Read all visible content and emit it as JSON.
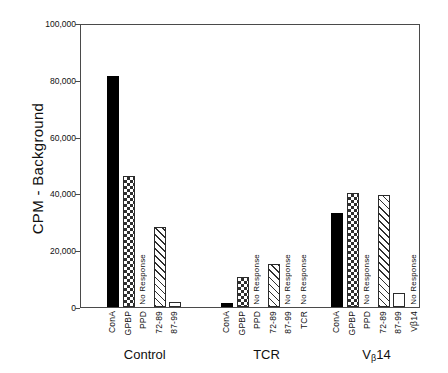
{
  "chart_data": {
    "type": "bar",
    "title": "",
    "xlabel": "",
    "ylabel": "CPM - Background",
    "ylim": [
      0,
      100000
    ],
    "yticks": [
      0,
      20000,
      40000,
      60000,
      80000,
      100000
    ],
    "ytick_labels": [
      "0",
      "20,000",
      "40,000",
      "60,000",
      "80,000",
      "100,000"
    ],
    "grid": false,
    "legend": "none",
    "groups": [
      {
        "name": "Control",
        "caption": "Control",
        "bars": [
          {
            "category": "ConA",
            "value": 81500,
            "fill": "solid",
            "annotation": ""
          },
          {
            "category": "GPBP",
            "value": 46000,
            "fill": "checker",
            "annotation": ""
          },
          {
            "category": "PPD",
            "value": 0,
            "fill": "none",
            "annotation": "No Response"
          },
          {
            "category": "72-89",
            "value": 28000,
            "fill": "diagonal",
            "annotation": ""
          },
          {
            "category": "87-99",
            "value": 1800,
            "fill": "open",
            "annotation": ""
          }
        ]
      },
      {
        "name": "TCR",
        "caption": "TCR",
        "bars": [
          {
            "category": "ConA",
            "value": 1500,
            "fill": "solid",
            "annotation": ""
          },
          {
            "category": "GPBP",
            "value": 10500,
            "fill": "checker",
            "annotation": ""
          },
          {
            "category": "PPD",
            "value": 0,
            "fill": "none",
            "annotation": "No Response"
          },
          {
            "category": "72-89",
            "value": 15000,
            "fill": "diagonal",
            "annotation": ""
          },
          {
            "category": "87-99",
            "value": 0,
            "fill": "none",
            "annotation": "No Response"
          },
          {
            "category": "TCR",
            "value": 0,
            "fill": "none",
            "annotation": "No Response"
          }
        ]
      },
      {
        "name": "VB14",
        "caption": "Vβ14",
        "caption_main": "V",
        "caption_sub": "β",
        "caption_tail": "14",
        "bars": [
          {
            "category": "ConA",
            "value": 33000,
            "fill": "solid",
            "annotation": ""
          },
          {
            "category": "GPBP",
            "value": 40000,
            "fill": "checker",
            "annotation": ""
          },
          {
            "category": "PPD",
            "value": 0,
            "fill": "none",
            "annotation": "No Response"
          },
          {
            "category": "72-89",
            "value": 39500,
            "fill": "diagonal",
            "annotation": ""
          },
          {
            "category": "87-99",
            "value": 5000,
            "fill": "open",
            "annotation": ""
          },
          {
            "category": "Vβ14",
            "value": 0,
            "fill": "none",
            "annotation": "No Response"
          }
        ]
      }
    ]
  },
  "axis": {
    "y_title": "CPM - Background"
  }
}
